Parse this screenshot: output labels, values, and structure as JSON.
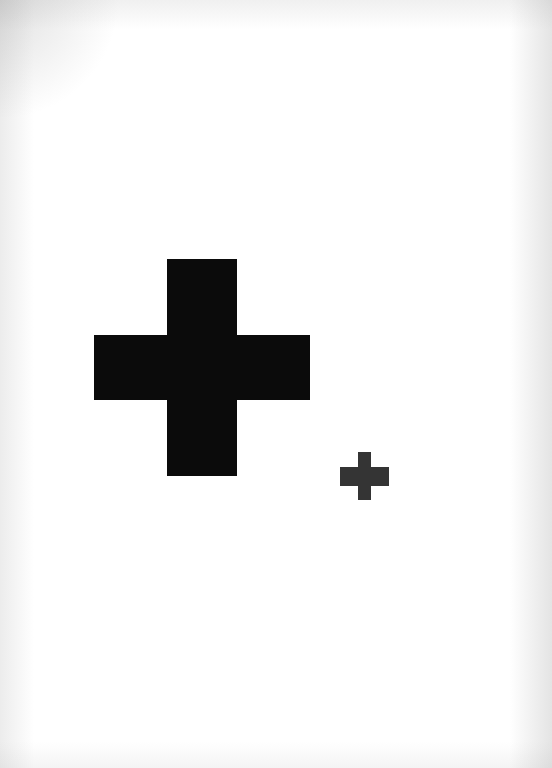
{
  "canvas": {
    "width": 552,
    "height": 768,
    "background_color": "#ffffff",
    "description": "Scanned white page showing two black plus / cross symbols of different sizes"
  },
  "shapes": [
    {
      "id": "cross-large",
      "label": "large-plus-sign",
      "glyph": "+",
      "color": "#0b0b0b",
      "x": 94,
      "y": 259,
      "width": 216,
      "height": 217,
      "stroke_thickness_vertical": 70,
      "stroke_thickness_horizontal": 65,
      "center_x": 205,
      "center_y": 372
    },
    {
      "id": "cross-small",
      "label": "small-plus-sign",
      "glyph": "+",
      "color": "#343434",
      "x": 340,
      "y": 452,
      "width": 49,
      "height": 48,
      "stroke_thickness_vertical": 13,
      "stroke_thickness_horizontal": 19,
      "center_x": 365,
      "center_y": 478
    }
  ]
}
